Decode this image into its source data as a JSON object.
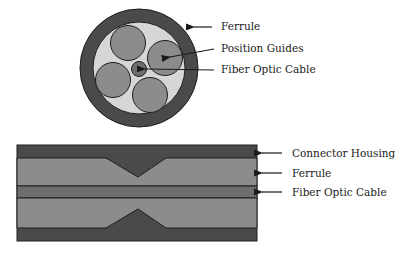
{
  "colors": {
    "dark": "#4a4a4a",
    "medium": "#8c8c8c",
    "light": "#d6d6d6",
    "core": "#6e6e6e",
    "outline": "#1e1e1e"
  },
  "cross_section": {
    "labels": [
      {
        "id": "ferrule",
        "text": "Ferrule"
      },
      {
        "id": "position-guides",
        "text": "Position Guides"
      },
      {
        "id": "fiber-optic-cable",
        "text": "Fiber Optic Cable"
      }
    ]
  },
  "longitudinal_section": {
    "labels": [
      {
        "id": "connector-housing",
        "text": "Connector Housing"
      },
      {
        "id": "ferrule",
        "text": "Ferrule"
      },
      {
        "id": "fiber-optic-cable",
        "text": "Fiber Optic Cable"
      }
    ]
  }
}
